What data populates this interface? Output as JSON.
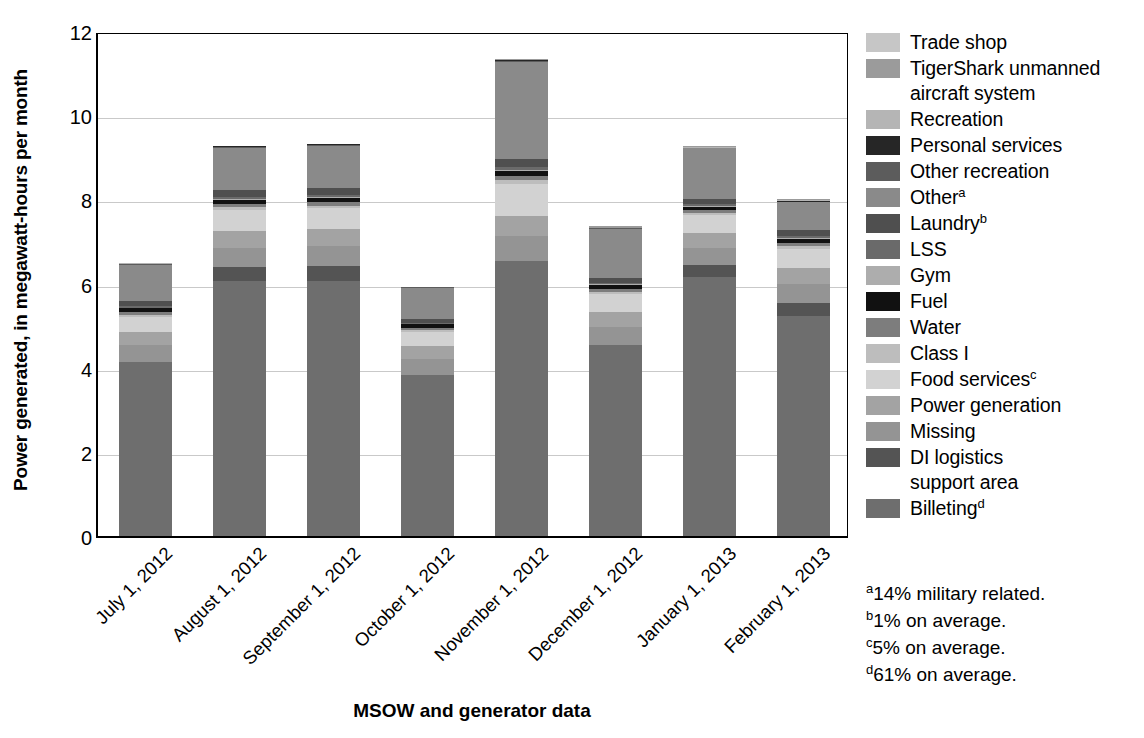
{
  "chart_data": {
    "type": "bar",
    "subtype": "stacked-bar",
    "title": "",
    "xlabel": "MSOW and generator data",
    "ylabel": "Power generated, in megawatt-hours per month",
    "ylim": [
      0,
      12
    ],
    "yticks": [
      0,
      2,
      4,
      6,
      8,
      10,
      12
    ],
    "grid": true,
    "legend_position": "right",
    "categories": [
      "July 1, 2012",
      "August 1, 2012",
      "September 1, 2012",
      "October 1, 2012",
      "November 1, 2012",
      "December 1, 2012",
      "January 1, 2013",
      "February 1, 2013"
    ],
    "totals": [
      6.48,
      9.28,
      9.33,
      5.92,
      11.33,
      7.37,
      9.26,
      8.01
    ],
    "series": [
      {
        "name": "Billeting",
        "color": "#6e6e6e",
        "values": [
          4.13,
          6.05,
          6.05,
          3.83,
          6.53,
          4.55,
          6.15,
          5.22
        ]
      },
      {
        "name": "DI logistics support area",
        "color": "#545454",
        "values": [
          0.0,
          0.35,
          0.37,
          0.0,
          0.0,
          0.0,
          0.3,
          0.31
        ]
      },
      {
        "name": "Missing",
        "color": "#949494",
        "values": [
          0.42,
          0.45,
          0.47,
          0.38,
          0.6,
          0.42,
          0.4,
          0.45
        ]
      },
      {
        "name": "Power generation",
        "color": "#a3a3a3",
        "values": [
          0.31,
          0.4,
          0.4,
          0.31,
          0.48,
          0.35,
          0.36,
          0.38
        ]
      },
      {
        "name": "Food services",
        "color": "#d2d2d2",
        "values": [
          0.35,
          0.5,
          0.5,
          0.34,
          0.75,
          0.44,
          0.42,
          0.47
        ]
      },
      {
        "name": "Class I",
        "color": "#bdbdbd",
        "values": [
          0.05,
          0.06,
          0.06,
          0.04,
          0.09,
          0.05,
          0.05,
          0.06
        ]
      },
      {
        "name": "Water",
        "color": "#7d7d7d",
        "values": [
          0.06,
          0.08,
          0.08,
          0.05,
          0.11,
          0.06,
          0.06,
          0.07
        ]
      },
      {
        "name": "Fuel",
        "color": "#111111",
        "values": [
          0.09,
          0.1,
          0.1,
          0.08,
          0.11,
          0.09,
          0.09,
          0.1
        ]
      },
      {
        "name": "Gym",
        "color": "#adadad",
        "values": [
          0.02,
          0.03,
          0.03,
          0.02,
          0.04,
          0.02,
          0.02,
          0.03
        ]
      },
      {
        "name": "LSS",
        "color": "#6a6a6a",
        "values": [
          0.03,
          0.04,
          0.04,
          0.02,
          0.05,
          0.03,
          0.03,
          0.04
        ]
      },
      {
        "name": "Laundry",
        "color": "#4f4f4f",
        "values": [
          0.13,
          0.17,
          0.17,
          0.1,
          0.2,
          0.13,
          0.13,
          0.15
        ]
      },
      {
        "name": "Other",
        "color": "#8a8a8a",
        "values": [
          0.86,
          1.0,
          1.01,
          0.73,
          2.31,
          1.16,
          1.2,
          0.66
        ]
      },
      {
        "name": "Other recreation",
        "color": "#5c5c5c",
        "values": [
          0.01,
          0.01,
          0.01,
          0.01,
          0.02,
          0.01,
          0.01,
          0.01
        ]
      },
      {
        "name": "Personal services",
        "color": "#262626",
        "values": [
          0.01,
          0.02,
          0.02,
          0.01,
          0.02,
          0.01,
          0.01,
          0.02
        ]
      },
      {
        "name": "Recreation",
        "color": "#b5b5b5",
        "values": [
          0.01,
          0.01,
          0.01,
          0.0,
          0.01,
          0.01,
          0.01,
          0.01
        ]
      },
      {
        "name": "TigerShark unmanned aircraft system",
        "color": "#9b9b9b",
        "values": [
          0.0,
          0.01,
          0.01,
          0.0,
          0.01,
          0.04,
          0.02,
          0.03
        ]
      },
      {
        "name": "Trade shop",
        "color": "#c6c6c6",
        "values": [
          0.0,
          0.0,
          0.0,
          0.0,
          0.0,
          0.0,
          0.0,
          0.0
        ]
      }
    ]
  },
  "axes": {
    "y_title": "Power generated, in megawatt-hours per month",
    "x_title": "MSOW and generator data",
    "y_tick_labels": [
      "12",
      "10",
      "8",
      "6",
      "4",
      "2",
      "0"
    ],
    "x_tick_labels": [
      "July 1, 2012",
      "August 1, 2012",
      "September 1, 2012",
      "October 1, 2012",
      "November 1, 2012",
      "December 1, 2012",
      "January 1, 2013",
      "February 1, 2013"
    ]
  },
  "legend": {
    "items": [
      {
        "label": "Trade shop",
        "sup": "",
        "color": "#c6c6c6",
        "extra_line": ""
      },
      {
        "label": "TigerShark unmanned",
        "sup": "",
        "color": "#9b9b9b",
        "extra_line": "aircraft system"
      },
      {
        "label": "Recreation",
        "sup": "",
        "color": "#b5b5b5",
        "extra_line": ""
      },
      {
        "label": "Personal services",
        "sup": "",
        "color": "#262626",
        "extra_line": ""
      },
      {
        "label": "Other recreation",
        "sup": "",
        "color": "#5c5c5c",
        "extra_line": ""
      },
      {
        "label": "Other",
        "sup": "a",
        "color": "#8a8a8a",
        "extra_line": ""
      },
      {
        "label": "Laundry",
        "sup": "b",
        "color": "#4f4f4f",
        "extra_line": ""
      },
      {
        "label": "LSS",
        "sup": "",
        "color": "#6a6a6a",
        "extra_line": ""
      },
      {
        "label": "Gym",
        "sup": "",
        "color": "#adadad",
        "extra_line": ""
      },
      {
        "label": "Fuel",
        "sup": "",
        "color": "#111111",
        "extra_line": ""
      },
      {
        "label": "Water",
        "sup": "",
        "color": "#7d7d7d",
        "extra_line": ""
      },
      {
        "label": "Class I",
        "sup": "",
        "color": "#bdbdbd",
        "extra_line": ""
      },
      {
        "label": "Food services",
        "sup": "c",
        "color": "#d2d2d2",
        "extra_line": ""
      },
      {
        "label": "Power generation",
        "sup": "",
        "color": "#a3a3a3",
        "extra_line": ""
      },
      {
        "label": "Missing",
        "sup": "",
        "color": "#949494",
        "extra_line": ""
      },
      {
        "label": "DI logistics",
        "sup": "",
        "color": "#545454",
        "extra_line": "support area"
      },
      {
        "label": "Billeting",
        "sup": "d",
        "color": "#6e6e6e",
        "extra_line": ""
      }
    ]
  },
  "footnotes": [
    {
      "marker": "a",
      "text": "14% military related."
    },
    {
      "marker": "b",
      "text": "1% on average."
    },
    {
      "marker": "c",
      "text": "5% on average."
    },
    {
      "marker": "d",
      "text": "61% on average."
    }
  ]
}
